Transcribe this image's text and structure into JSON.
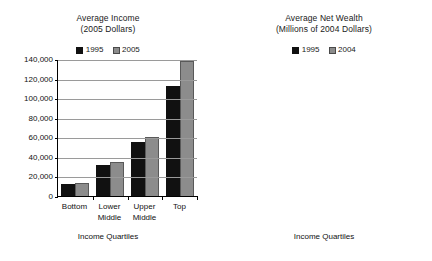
{
  "chart_data": [
    {
      "id": "average-income",
      "type": "bar",
      "title": "Average Income",
      "subtitle": "(2005 Dollars)",
      "title_lines": [
        "Average Income",
        "(2005 Dollars)"
      ],
      "xlabel": "Income Quartiles",
      "ylabel": "",
      "categories": [
        "Bottom",
        "Lower Middle",
        "Upper Middle",
        "Top"
      ],
      "category_lines": [
        [
          "Bottom"
        ],
        [
          "Lower",
          "Middle"
        ],
        [
          "Upper",
          "Middle"
        ],
        [
          "Top"
        ]
      ],
      "series": [
        {
          "name": "1995",
          "color": "#111111",
          "values": [
            12500,
            32000,
            55500,
            112000
          ]
        },
        {
          "name": "2005",
          "color": "#8c8c8c",
          "values": [
            13000,
            34500,
            60000,
            138000
          ]
        }
      ],
      "ylim": [
        0,
        140000
      ],
      "yticks": [
        0,
        20000,
        40000,
        60000,
        80000,
        100000,
        120000,
        140000
      ],
      "ytick_labels": [
        "0",
        "20,000",
        "40,000",
        "60,000",
        "80,000",
        "100,000",
        "120,000",
        "140,000"
      ],
      "grid": true,
      "legend_position": "top-center",
      "legend": [
        "1995",
        "2005"
      ]
    },
    {
      "id": "average-net-wealth",
      "type": "bar",
      "title": "Average Net Wealth",
      "subtitle": "(Millions of 2004 Dollars)",
      "title_lines": [
        "Average Net Wealth",
        "(Millions of 2004 Dollars)"
      ],
      "xlabel": "Income Quartiles",
      "ylabel": "",
      "categories": [
        "Bottom",
        "Lower Middle",
        "Upper Middle",
        "Top"
      ],
      "category_lines": [
        [
          "Bottom"
        ],
        [
          "Lower",
          "Middle"
        ],
        [
          "Upper",
          "Middle"
        ],
        [
          "Top"
        ]
      ],
      "series": [
        {
          "name": "1995",
          "color": "#111111",
          "values": [
            0.05,
            0.105,
            0.145,
            0.685
          ]
        },
        {
          "name": "2004",
          "color": "#8c8c8c",
          "values": [
            0.075,
            0.14,
            0.27,
            1.255
          ]
        }
      ],
      "ylim": [
        0,
        1.4
      ],
      "yticks": [
        0,
        0.2,
        0.4,
        0.6,
        0.8,
        1.0,
        1.2,
        1.4
      ],
      "ytick_labels": [
        "0.0",
        "0.2",
        "0.4",
        "0.6",
        "0.8",
        "1.0",
        "1.2",
        "1.4"
      ],
      "grid": true,
      "legend_position": "top-center",
      "legend": [
        "1995",
        "2004"
      ]
    }
  ],
  "panels": {
    "income": {
      "title_line1": "Average Income",
      "title_line2": "(2005 Dollars)",
      "legend": [
        {
          "label": "1995",
          "swatch": "black"
        },
        {
          "label": "2005",
          "swatch": "gray"
        }
      ],
      "ytick_labels": [
        "140,000",
        "120,000",
        "100,000",
        "80,000",
        "60,000",
        "40,000",
        "20,000",
        "0"
      ],
      "categories": [
        {
          "line1": "Bottom",
          "line2": ""
        },
        {
          "line1": "Lower",
          "line2": "Middle"
        },
        {
          "line1": "Upper",
          "line2": "Middle"
        },
        {
          "line1": "Top",
          "line2": ""
        }
      ],
      "axis_title": "Income Quartiles"
    },
    "wealth": {
      "title_line1": "Average Net Wealth",
      "title_line2": "(Millions of 2004 Dollars)",
      "legend": [
        {
          "label": "1995",
          "swatch": "black"
        },
        {
          "label": "2004",
          "swatch": "gray"
        }
      ],
      "ytick_labels": [
        "1.4",
        "1.2",
        "1.0",
        "0.8",
        "0.6",
        "0.4",
        "0.2",
        "0.0"
      ],
      "categories": [
        {
          "line1": "Bottom",
          "line2": ""
        },
        {
          "line1": "Lower",
          "line2": "Middle"
        },
        {
          "line1": "Upper",
          "line2": "Middle"
        },
        {
          "line1": "Top",
          "line2": ""
        }
      ],
      "axis_title": "Income Quartiles"
    }
  },
  "colors": {
    "series_1995": "#111111",
    "series_latest": "#8c8c8c",
    "gridline": "#9a9a9a",
    "axis": "#000000",
    "background": "#ffffff"
  }
}
